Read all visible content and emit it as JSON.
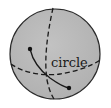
{
  "diagram": {
    "type": "sphere-with-great-circle",
    "label": "circle",
    "colors": {
      "sphere_fill": "#b9b9b9",
      "outline": "#2a2a2a",
      "line": "#1a1a1a",
      "background": "#ffffff"
    },
    "elements": [
      {
        "kind": "sphere",
        "description": "shaded sphere outline"
      },
      {
        "kind": "dashed-meridian",
        "description": "vertical dashed great circle"
      },
      {
        "kind": "dashed-equator",
        "description": "horizontal dashed great circle"
      },
      {
        "kind": "arc",
        "description": "solid arc between two points"
      },
      {
        "kind": "point",
        "description": "start point of arc"
      },
      {
        "kind": "point",
        "description": "end point of arc"
      }
    ]
  }
}
